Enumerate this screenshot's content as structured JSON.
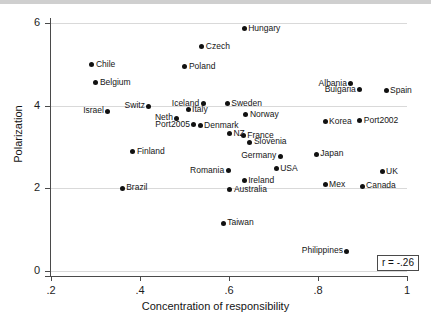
{
  "chart_data": {
    "type": "scatter",
    "title": "",
    "xlabel": "Concentration of responsibility",
    "ylabel": "Polarization",
    "xlim": [
      0.2,
      1.0
    ],
    "ylim": [
      0,
      6
    ],
    "xticks": [
      ".2",
      ".4",
      ".6",
      ".8",
      "1"
    ],
    "xtick_values": [
      0.2,
      0.4,
      0.6,
      0.8,
      1.0
    ],
    "yticks": [
      "0",
      "2",
      "4",
      "6"
    ],
    "ytick_values": [
      0,
      2,
      4,
      6
    ],
    "grid": "horizontal",
    "legend": "none",
    "annotation": "r = -.26",
    "marker_color": "#111111",
    "grid_color": "#d9d9d9",
    "points": [
      {
        "label": "Hungary",
        "x": 0.634,
        "y": 5.86,
        "side": "right"
      },
      {
        "label": "Czech",
        "x": 0.539,
        "y": 5.42,
        "side": "right"
      },
      {
        "label": "Poland",
        "x": 0.501,
        "y": 4.94,
        "side": "right"
      },
      {
        "label": "Chile",
        "x": 0.292,
        "y": 4.99,
        "side": "right"
      },
      {
        "label": "Belgium",
        "x": 0.301,
        "y": 4.55,
        "side": "right"
      },
      {
        "label": "Albania",
        "x": 0.874,
        "y": 4.53,
        "side": "left"
      },
      {
        "label": "Bulgaria",
        "x": 0.894,
        "y": 4.38,
        "side": "left"
      },
      {
        "label": "Spain",
        "x": 0.953,
        "y": 4.36,
        "side": "right"
      },
      {
        "label": "Switz",
        "x": 0.42,
        "y": 3.99,
        "side": "left"
      },
      {
        "label": "Iceland",
        "x": 0.542,
        "y": 4.05,
        "side": "left"
      },
      {
        "label": "Sweden",
        "x": 0.596,
        "y": 4.05,
        "side": "right"
      },
      {
        "label": "Israel",
        "x": 0.328,
        "y": 3.87,
        "side": "left"
      },
      {
        "label": "Italy",
        "x": 0.508,
        "y": 3.9,
        "side": "right"
      },
      {
        "label": "Norway",
        "x": 0.638,
        "y": 3.78,
        "side": "right"
      },
      {
        "label": "Neth",
        "x": 0.483,
        "y": 3.7,
        "side": "left"
      },
      {
        "label": "Korea",
        "x": 0.816,
        "y": 3.61,
        "side": "right"
      },
      {
        "label": "Port2002",
        "x": 0.894,
        "y": 3.63,
        "side": "right"
      },
      {
        "label": "Denmark",
        "x": 0.535,
        "y": 3.51,
        "side": "right"
      },
      {
        "label": "Port2005",
        "x": 0.521,
        "y": 3.54,
        "side": "left"
      },
      {
        "label": "NZ",
        "x": 0.601,
        "y": 3.32,
        "side": "right"
      },
      {
        "label": "France",
        "x": 0.632,
        "y": 3.27,
        "side": "right"
      },
      {
        "label": "Slovenia",
        "x": 0.647,
        "y": 3.12,
        "side": "right"
      },
      {
        "label": "Finland",
        "x": 0.384,
        "y": 2.88,
        "side": "right"
      },
      {
        "label": "Japan",
        "x": 0.796,
        "y": 2.83,
        "side": "right"
      },
      {
        "label": "Germany",
        "x": 0.715,
        "y": 2.78,
        "side": "left"
      },
      {
        "label": "USA",
        "x": 0.706,
        "y": 2.47,
        "side": "right"
      },
      {
        "label": "Romania",
        "x": 0.598,
        "y": 2.42,
        "side": "left"
      },
      {
        "label": "UK",
        "x": 0.944,
        "y": 2.4,
        "side": "right"
      },
      {
        "label": "Ireland",
        "x": 0.634,
        "y": 2.18,
        "side": "right"
      },
      {
        "label": "Mex",
        "x": 0.816,
        "y": 2.09,
        "side": "right"
      },
      {
        "label": "Canada",
        "x": 0.899,
        "y": 2.05,
        "side": "right"
      },
      {
        "label": "Australia",
        "x": 0.602,
        "y": 1.96,
        "side": "right"
      },
      {
        "label": "Brazil",
        "x": 0.36,
        "y": 2.0,
        "side": "right"
      },
      {
        "label": "Taiwan",
        "x": 0.587,
        "y": 1.16,
        "side": "right"
      },
      {
        "label": "Philippines",
        "x": 0.865,
        "y": 0.48,
        "side": "left"
      }
    ]
  }
}
